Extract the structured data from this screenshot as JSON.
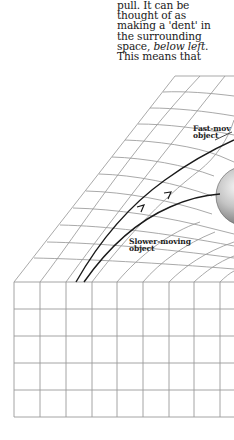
{
  "body_text": {
    "lines": [
      {
        "text": "pull. It can be"
      },
      {
        "text": "thought of as"
      },
      {
        "text": "making a 'dent' in"
      },
      {
        "text": "the surrounding"
      },
      {
        "text_plain": "space, ",
        "text_italic": "below left",
        "text_tail": "."
      },
      {
        "text": "This means that"
      }
    ]
  },
  "figure": {
    "labels": {
      "fast_object": {
        "line1": "Fast-mov",
        "line2": "object"
      },
      "slow_object": {
        "line1": "Slower-moving",
        "line2": "object"
      }
    },
    "icons": {
      "massive_body": "sphere-icon",
      "trajectory_arrow": "arrow-up-icon"
    },
    "colors": {
      "grid": "#9a9a9a",
      "trajectory": "#1a1a1a",
      "sphere_light": "#f2f2f2",
      "sphere_dark": "#6e6e6e",
      "text": "#1a1a1a"
    }
  }
}
